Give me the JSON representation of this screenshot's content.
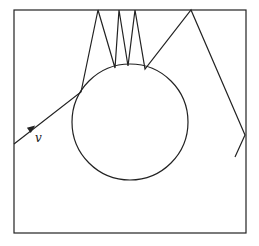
{
  "diagram": {
    "colors": {
      "stroke": "#222222",
      "background": "#ffffff"
    },
    "box": {
      "x": 14,
      "y": 10,
      "width": 232,
      "height": 223
    },
    "circle": {
      "cx": 130,
      "cy": 122,
      "r": 58
    },
    "velocity_label": "v",
    "velocity_label_pos": {
      "x": 35,
      "y": 142
    },
    "arrow": {
      "x": 32,
      "y": 128,
      "angle": -37
    },
    "trajectory": [
      [
        14,
        144
      ],
      [
        81,
        92
      ],
      [
        98,
        10
      ],
      [
        115,
        68
      ],
      [
        119,
        10
      ],
      [
        128,
        66
      ],
      [
        135,
        10
      ],
      [
        145,
        69
      ],
      [
        191,
        10
      ],
      [
        245,
        135
      ],
      [
        235,
        157
      ]
    ]
  }
}
